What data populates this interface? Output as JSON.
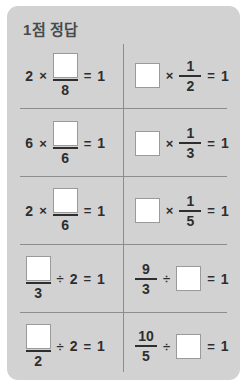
{
  "card": {
    "title": "1점 정답",
    "background_color": "#d2d2d2",
    "divider_color": "#8d8d8d",
    "text_color": "#2e2e2e",
    "title_color": "#4a4a4a",
    "answer_box_fill": "#ffffff",
    "answer_box_border": "#9a9a9a"
  },
  "problems": [
    {
      "row": 1,
      "column": "left",
      "expression": "2 × □/8 = 1",
      "multiplier": "2",
      "operator": "×",
      "numerator": "",
      "denominator": "8",
      "equals": "=",
      "result": "1"
    },
    {
      "row": 1,
      "column": "right",
      "expression": "□ × 1/2 = 1",
      "operator": "×",
      "numerator": "1",
      "denominator": "2",
      "equals": "=",
      "result": "1"
    },
    {
      "row": 2,
      "column": "left",
      "expression": "6 × □/6 = 1",
      "multiplier": "6",
      "operator": "×",
      "numerator": "",
      "denominator": "6",
      "equals": "=",
      "result": "1"
    },
    {
      "row": 2,
      "column": "right",
      "expression": "□ × 1/3 = 1",
      "operator": "×",
      "numerator": "1",
      "denominator": "3",
      "equals": "=",
      "result": "1"
    },
    {
      "row": 3,
      "column": "left",
      "expression": "2 × □/6 = 1",
      "multiplier": "2",
      "operator": "×",
      "numerator": "",
      "denominator": "6",
      "equals": "=",
      "result": "1"
    },
    {
      "row": 3,
      "column": "right",
      "expression": "□ × 1/5 = 1",
      "operator": "×",
      "numerator": "1",
      "denominator": "5",
      "equals": "=",
      "result": "1"
    },
    {
      "row": 4,
      "column": "left",
      "expression": "□/3 ÷ 2 = 1",
      "numerator": "",
      "denominator": "3",
      "operator": "÷",
      "divisor": "2",
      "equals": "=",
      "result": "1"
    },
    {
      "row": 4,
      "column": "right",
      "expression": "9/3 ÷ □ = 1",
      "numerator": "9",
      "denominator": "3",
      "operator": "÷",
      "divisor": "",
      "equals": "=",
      "result": "1"
    },
    {
      "row": 5,
      "column": "left",
      "expression": "□/2 ÷ 2 = 1",
      "numerator": "",
      "denominator": "2",
      "operator": "÷",
      "divisor": "2",
      "equals": "=",
      "result": "1"
    },
    {
      "row": 5,
      "column": "right",
      "expression": "10/5 ÷ □ = 1",
      "numerator": "10",
      "denominator": "5",
      "operator": "÷",
      "divisor": "",
      "equals": "=",
      "result": "1"
    }
  ]
}
